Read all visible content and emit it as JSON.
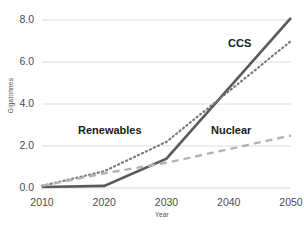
{
  "chart_data": {
    "type": "line",
    "title": "",
    "xlabel": "Year",
    "ylabel": "Gigatonnes",
    "x": [
      2010,
      2020,
      2030,
      2040,
      2050
    ],
    "xlim": [
      2010,
      2050
    ],
    "ylim": [
      0.0,
      8.0
    ],
    "grid": true,
    "legend_position": "inline-annotations",
    "y_ticks": [
      "0.0",
      "2.0",
      "4.0",
      "6.0",
      "8.0"
    ],
    "y_tick_values": [
      0.0,
      2.0,
      4.0,
      6.0,
      8.0
    ],
    "x_ticks": [
      "2010",
      "2020",
      "2030",
      "2040",
      "2050"
    ],
    "series": [
      {
        "name": "CCS",
        "style": "solid",
        "color": "#5a5a5a",
        "x": [
          2010,
          2020,
          2030,
          2050
        ],
        "values": [
          0.05,
          0.1,
          1.4,
          8.1
        ]
      },
      {
        "name": "Renewables",
        "style": "dotted",
        "color": "#7a7a7a",
        "x": [
          2010,
          2020,
          2030,
          2040,
          2050
        ],
        "values": [
          0.1,
          0.8,
          2.2,
          4.6,
          7.0
        ]
      },
      {
        "name": "Nuclear",
        "style": "dashed",
        "color": "#b3b3b3",
        "x": [
          2010,
          2020,
          2030,
          2040,
          2050
        ],
        "values": [
          0.1,
          0.7,
          1.2,
          1.85,
          2.5
        ]
      }
    ],
    "annotations": [
      {
        "text": "CCS",
        "series": "CCS"
      },
      {
        "text": "Renewables",
        "series": "Renewables"
      },
      {
        "text": "Nuclear",
        "series": "Nuclear"
      }
    ]
  },
  "axis": {
    "y_title": "Gigatonnes",
    "x_title": "Year",
    "y_labels": [
      "8.0",
      "6.0",
      "4.0",
      "2.0",
      "0.0"
    ],
    "x_labels": [
      "2010",
      "2020",
      "2030",
      "2040",
      "2050"
    ]
  },
  "labels": {
    "ccs": "CCS",
    "renewables": "Renewables",
    "nuclear": "Nuclear"
  },
  "colors": {
    "grid": "#d9d9d9",
    "ccs": "#5a5a5a",
    "renewables": "#7a7a7a",
    "nuclear": "#b3b3b3",
    "text": "#4d4d4d",
    "label_text": "#1a1a1a",
    "background": "#ffffff"
  }
}
